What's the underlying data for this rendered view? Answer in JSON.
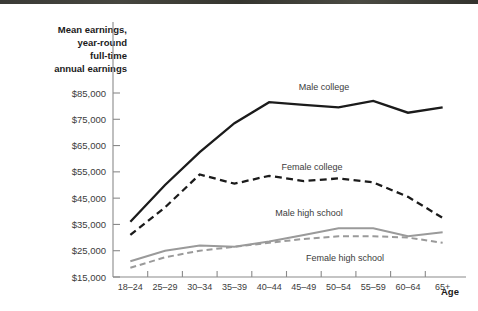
{
  "chart_data": {
    "type": "line",
    "title": "",
    "ylabel_lines": [
      "Mean earnings,",
      "year-round",
      "full-time",
      "annual earnings"
    ],
    "xlabel": "Age",
    "categories": [
      "18–24",
      "25–29",
      "30–34",
      "35–39",
      "40–44",
      "45–49",
      "50–54",
      "55–59",
      "60–64",
      "65+"
    ],
    "ytick_labels": [
      "$85,000",
      "$75,000",
      "$65,000",
      "$55,000",
      "$45,000",
      "$35,000",
      "$25,000",
      "$15,000"
    ],
    "ytick_values": [
      85000,
      75000,
      65000,
      55000,
      45000,
      35000,
      25000,
      15000
    ],
    "ylim": [
      15000,
      90000
    ],
    "grid": false,
    "legend_position": "inline-annotations",
    "series": [
      {
        "name": "Male college",
        "label": "Male college",
        "color": "#1b1b1b",
        "style": "solid",
        "width": 2.3,
        "values": [
          36000,
          50000,
          62500,
          73500,
          81500,
          80500,
          79500,
          82000,
          77500,
          79500
        ]
      },
      {
        "name": "Female college",
        "label": "Female college",
        "color": "#1b1b1b",
        "style": "dashed",
        "width": 2.3,
        "values": [
          31000,
          41500,
          54000,
          50500,
          53500,
          51500,
          52500,
          51000,
          45500,
          37500
        ]
      },
      {
        "name": "Male high school",
        "label": "Male high school",
        "color": "#9a9a9a",
        "style": "solid",
        "width": 2.0,
        "values": [
          21000,
          25000,
          27000,
          26500,
          28500,
          31000,
          33500,
          33500,
          30500,
          32000
        ]
      },
      {
        "name": "Female high school",
        "label": "Female high school",
        "color": "#9a9a9a",
        "style": "dashed",
        "width": 2.0,
        "values": [
          18500,
          22500,
          25000,
          26500,
          28000,
          29500,
          30500,
          30500,
          30000,
          28000
        ]
      }
    ],
    "annotations": [
      {
        "text": "Male college",
        "x": 324,
        "y": 90
      },
      {
        "text": "Female college",
        "x": 312,
        "y": 170
      },
      {
        "text": "Male high school",
        "x": 309,
        "y": 216
      },
      {
        "text": "Female high school",
        "x": 345,
        "y": 261
      }
    ],
    "colors": {
      "college_line": "#1b1b1b",
      "highschool_line": "#9a9a9a",
      "axis": "#8a8a8a",
      "text": "#3c3c3c",
      "background": "#ffffff"
    }
  },
  "layout": {
    "plot_left": 113,
    "plot_right": 460,
    "plot_top": 88,
    "plot_bottom": 277,
    "y_top_value": 85000,
    "y_bottom_value": 15000,
    "y_top_px": 93,
    "y_bottom_px": 277
  }
}
